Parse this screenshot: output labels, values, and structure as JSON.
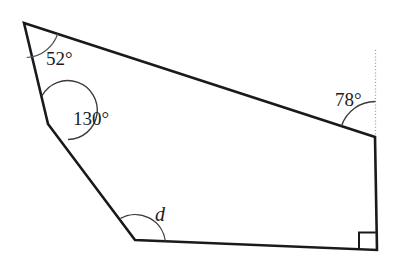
{
  "figure": {
    "kind": "polygon-angle-diagram",
    "shape_name": "pentagon",
    "background_color": "#ffffff",
    "line_color": "#1a1a1a",
    "arc_color": "#55565a",
    "dotted_guide_color": "#9a9a9a",
    "vertices": [
      {
        "name": "top-left-vertex",
        "x": 24,
        "y": 23
      },
      {
        "name": "upper-left-vertex",
        "x": 48,
        "y": 124
      },
      {
        "name": "bottom-left-vertex",
        "x": 135,
        "y": 240
      },
      {
        "name": "bottom-right-vertex",
        "x": 377,
        "y": 250
      },
      {
        "name": "top-right-vertex",
        "x": 375,
        "y": 137
      }
    ],
    "guide_line": {
      "name": "vertical-extension",
      "x": 375,
      "y_top": 50,
      "y_bottom": 137,
      "style": "dotted"
    },
    "labels": {
      "angle_top_left": "52°",
      "angle_upper_left": "130°",
      "angle_bottom_left": "d",
      "angle_top_right": "78°"
    },
    "markers": {
      "right_angle": {
        "name": "right-angle-square",
        "at_vertex": "bottom-right-vertex",
        "size": 17
      }
    }
  }
}
